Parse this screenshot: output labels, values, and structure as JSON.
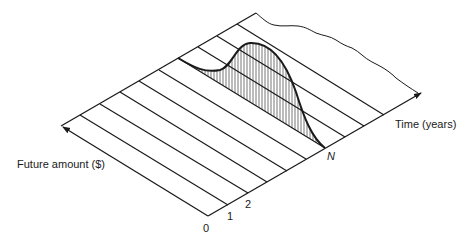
{
  "diagram": {
    "title": "",
    "labels": {
      "future_amount_axis": "Future amount ($)",
      "time_axis": "Time (years)",
      "tick_0": "0",
      "tick_1": "1",
      "tick_2": "2",
      "tick_n": "N"
    },
    "colors": {
      "stroke": "#1a1a1a",
      "background": "#ffffff"
    },
    "elements": [
      "isometric plane with parallel stripes (one per year)",
      "time axis arrow along front edge",
      "future amount axis arrow along left edge",
      "hatched bell-shaped distribution curve spanning the stripes up to period N",
      "wavy far edge indicating continuation"
    ]
  }
}
